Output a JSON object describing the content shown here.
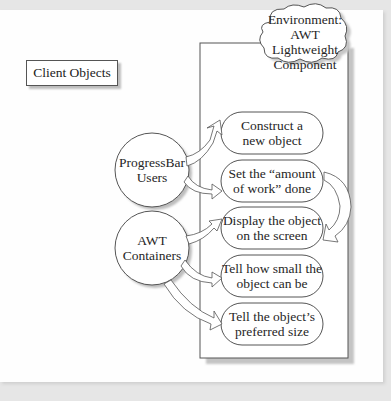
{
  "diagram": {
    "client_label": "Client Objects",
    "environment": {
      "line1": "Environment:",
      "line2": "AWT Lightweight",
      "line3": "Component"
    },
    "clients": [
      {
        "line1": "ProgressBar",
        "line2": "Users"
      },
      {
        "line1": "AWT",
        "line2": "Containers"
      }
    ],
    "services": [
      {
        "line1": "Construct a",
        "line2": "new object"
      },
      {
        "line1": "Set the “amount",
        "line2": "of work” done"
      },
      {
        "line1": "Display the object",
        "line2": "on the screen"
      },
      {
        "line1": "Tell how small the",
        "line2": "object can be"
      },
      {
        "line1": "Tell the object’s",
        "line2": "preferred size"
      }
    ],
    "colors": {
      "background": "#e6e6e6",
      "panel": "#fefefe",
      "stroke": "#555555",
      "shadow": "#bdbdbd"
    }
  }
}
